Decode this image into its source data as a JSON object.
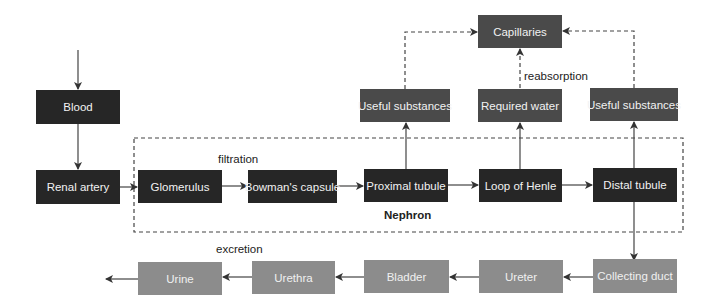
{
  "diagram": {
    "nodes": {
      "blood": "Blood",
      "renal_artery": "Renal artery",
      "glomerulus": "Glomerulus",
      "bowmans_capsule": "Bowman's capsule",
      "proximal_tubule": "Proximal tubule",
      "loop_of_henle": "Loop of Henle",
      "distal_tubule": "Distal tubule",
      "useful_substances_1": "Useful substances",
      "required_water": "Required water",
      "useful_substances_2": "Useful substances",
      "capillaries": "Capillaries",
      "collecting_duct": "Collecting duct",
      "ureter": "Ureter",
      "bladder": "Bladder",
      "urethra": "Urethra",
      "urine": "Urine"
    },
    "labels": {
      "filtration": "filtration",
      "reabsorption": "reabsorption",
      "excretion": "excretion",
      "nephron": "Nephron"
    },
    "colors": {
      "dark_box": "#262626",
      "mid_box": "#4a4a4a",
      "light_box": "#8c8c8c",
      "line": "#444444"
    },
    "edges": [
      [
        "(input)",
        "Blood"
      ],
      [
        "Blood",
        "Renal artery"
      ],
      [
        "Renal artery",
        "Glomerulus"
      ],
      [
        "Glomerulus",
        "Bowman's capsule"
      ],
      [
        "Bowman's capsule",
        "Proximal tubule"
      ],
      [
        "Proximal tubule",
        "Loop of Henle"
      ],
      [
        "Loop of Henle",
        "Distal tubule"
      ],
      [
        "Proximal tubule",
        "Useful substances"
      ],
      [
        "Loop of Henle",
        "Required water"
      ],
      [
        "Distal tubule",
        "Useful substances"
      ],
      [
        "Useful substances",
        "Capillaries",
        "dashed"
      ],
      [
        "Required water",
        "Capillaries",
        "dashed"
      ],
      [
        "Useful substances",
        "Capillaries",
        "dashed"
      ],
      [
        "Distal tubule",
        "Collecting duct"
      ],
      [
        "Collecting duct",
        "Ureter"
      ],
      [
        "Ureter",
        "Bladder"
      ],
      [
        "Bladder",
        "Urethra"
      ],
      [
        "Urethra",
        "Urine"
      ],
      [
        "Urine",
        "(output)"
      ]
    ]
  }
}
